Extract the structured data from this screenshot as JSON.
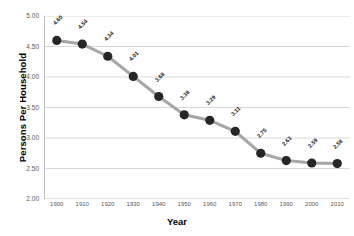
{
  "chart_data": {
    "type": "line",
    "title": "",
    "xlabel": "Year",
    "ylabel": "Persons Per Household",
    "categories": [
      "1900",
      "1910",
      "1920",
      "1930",
      "1940",
      "1950",
      "1960",
      "1970",
      "1980",
      "1990",
      "2000",
      "2010"
    ],
    "x": [
      1900,
      1910,
      1920,
      1930,
      1940,
      1950,
      1960,
      1970,
      1980,
      1990,
      2000,
      2010
    ],
    "values": [
      4.6,
      4.54,
      4.34,
      4.01,
      3.68,
      3.38,
      3.29,
      3.11,
      2.75,
      2.63,
      2.59,
      2.58
    ],
    "point_labels": [
      "4.60",
      "4.54",
      "4.34",
      "4.01",
      "3.68",
      "3.38",
      "3.29",
      "3.11",
      "2.75",
      "2.63",
      "2.59",
      "2.58"
    ],
    "ylim": [
      2.0,
      5.0
    ],
    "ytick_values": [
      5.0,
      4.5,
      4.0,
      3.5,
      3.0,
      2.5,
      2.0
    ],
    "ytick_labels": [
      "5.00",
      "4.50",
      "4.00",
      "3.50",
      "3.00",
      "2.50",
      "2.00"
    ],
    "xtick_labels": [
      "1900",
      "1910",
      "1920",
      "1930",
      "1940",
      "1950",
      "1960",
      "1970",
      "1980",
      "1990",
      "2000",
      "2010"
    ],
    "grid": "horizontal",
    "legend": "none",
    "series_name": "Persons Per Household",
    "colors": {
      "line": "#a6a6a6",
      "marker": "#262626",
      "grid": "#d9d9d9",
      "axis": "#bfbfbf",
      "text": "#595959",
      "title_text": "#000000",
      "background": "#ffffff"
    }
  }
}
